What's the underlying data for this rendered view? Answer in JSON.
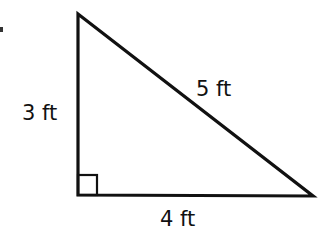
{
  "diagram": {
    "type": "right-triangle",
    "stroke_color": "#111111",
    "background": "#ffffff",
    "vertices": {
      "top": [
        78,
        14
      ],
      "right_angle": [
        78,
        195
      ],
      "right": [
        313,
        196
      ]
    },
    "right_angle_marker": {
      "x": 78,
      "y": 175,
      "size": 19
    },
    "labels": {
      "vertical_leg": "3 ft",
      "hypotenuse": "5 ft",
      "horizontal_leg": "4 ft"
    }
  }
}
